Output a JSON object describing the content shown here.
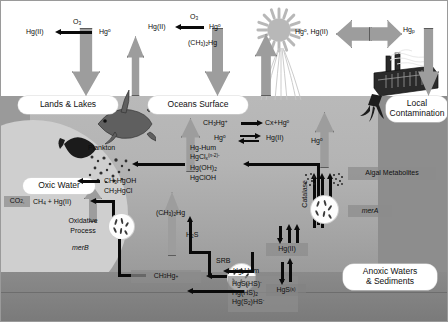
{
  "diagram": {
    "zones": {
      "sky_color": "#ffffff",
      "surface_water_color": "#b9b9b9",
      "oxic_zone_color": "#cfcfcf",
      "deep_sediment_color": "#7a7a7a",
      "land_color": "#9a9a9a",
      "arrow_grey": "#9d9d9d",
      "arrow_black": "#0a0a0a"
    }
  },
  "compartments": [
    {
      "id": "lands_lakes",
      "label": "Lands & Lakes"
    },
    {
      "id": "oceans_surface",
      "label": "Oceans Surface"
    },
    {
      "id": "local_contamination",
      "label": "Local\nContamination"
    },
    {
      "id": "oxic_water",
      "label": "Oxic Water"
    },
    {
      "id": "anoxic",
      "label": "Anoxic Waters\n& Sediments"
    }
  ],
  "compartment_labels": {
    "lands_lakes": "Lands & Lakes",
    "oceans_surface": "Oceans Surface",
    "local_contamination_1": "Local",
    "local_contamination_2": "Contamination",
    "oxic_water": "Oxic Water",
    "anoxic_1": "Anoxic Waters",
    "anoxic_2": "& Sediments"
  },
  "atmosphere": {
    "land_reaction": {
      "left": "Hg(II)",
      "oxidant": "O3",
      "right": "Hg0"
    },
    "ocean_reaction": {
      "left": "Hg(II)",
      "oxidant": "O3",
      "right": "Hg0"
    },
    "dimethylmercury": "(CH3)2Hg",
    "factory_emission": "Hg0, Hg(II)",
    "particulate": "Hgp"
  },
  "surface_reactions": {
    "photodegradation": {
      "reactant": "CH3Hg+",
      "products": "Cx+Hg0"
    },
    "redox": {
      "left": "Hg0",
      "right": "Hg(II)"
    }
  },
  "species": {
    "inorganic_complexes": [
      "Hg-Hum",
      "HgClx(n-2)-",
      "Hg(OH)2",
      "HgClOH"
    ],
    "methyl_species": [
      "CH3HgOH",
      "CH3HgCl"
    ],
    "sulfide_complexes": [
      "Hg-Hum",
      "HgS(HS)-",
      "Hg(HS)2",
      "Hg(S2)HS-"
    ],
    "methylmercury": "CH3Hg+",
    "mercuric_sulfide": "HgS(s)",
    "mercury_ii": "Hg(II)",
    "elemental_mercury": "Hg0",
    "dimethylmercury": "(CH3)2Hg",
    "hydrogen_sulfide": "H2S",
    "demethylation_products": "CO2,  CH4 + Hg(II)"
  },
  "biota": {
    "plankton": "Plankton",
    "srb": "SRB",
    "algal_metabolites": "Algal Metabolites",
    "catalase": "Catalase"
  },
  "genes": {
    "mer_b": "merB",
    "mer_a": "merA"
  },
  "processes": {
    "oxidative_line1": "Oxidative",
    "oxidative_line2": "Process"
  }
}
